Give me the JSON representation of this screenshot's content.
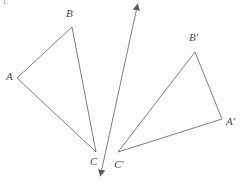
{
  "figure": {
    "caption_number": "1.",
    "background_color": "#fdfdfd",
    "stroke_color": "#6f6f6f",
    "label_color": "#4a4a4a"
  },
  "labels": {
    "a": "A",
    "b": "B",
    "c": "C",
    "a_prime": "A′",
    "b_prime": "B′",
    "c_prime": "C′"
  },
  "geometry": {
    "triangle_abc": {
      "name": "triangle-abc",
      "points": "17,78 72,27 96,152",
      "vertices": {
        "A": {
          "x": 17,
          "y": 78
        },
        "B": {
          "x": 72,
          "y": 27
        },
        "C": {
          "x": 96,
          "y": 152
        }
      }
    },
    "triangle_abc_prime": {
      "name": "triangle-a-prime-b-prime-c-prime",
      "points": "222,119 195,52 118,152",
      "vertices": {
        "A'": {
          "x": 222,
          "y": 119
        },
        "B'": {
          "x": 195,
          "y": 52
        },
        "C'": {
          "x": 118,
          "y": 152
        }
      }
    },
    "mirror_line": {
      "name": "line-of-reflection",
      "x1": 137,
      "y1": 4,
      "x2": 101,
      "y2": 176,
      "arrowheads": "both"
    }
  },
  "label_positions": {
    "a": {
      "left": 6,
      "top": 71
    },
    "b": {
      "left": 66,
      "top": 8
    },
    "c": {
      "left": 90,
      "top": 156
    },
    "a_prime": {
      "left": 226,
      "top": 116
    },
    "b_prime": {
      "left": 189,
      "top": 32
    },
    "c_prime": {
      "left": 114,
      "top": 159
    }
  }
}
